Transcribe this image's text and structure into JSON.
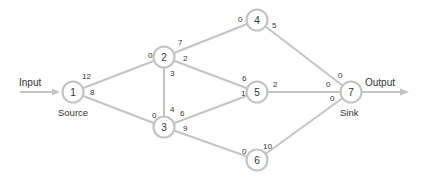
{
  "colors": {
    "edge": "#c4c4c4",
    "node_stroke": "#c4c4c4",
    "node_fill": "#ffffff",
    "text": "#333333"
  },
  "labels": {
    "input": "Input",
    "output": "Output",
    "source": "Source",
    "sink": "Sink"
  },
  "nodes": [
    {
      "id": "1",
      "label": "1",
      "x": 73,
      "y": 92
    },
    {
      "id": "2",
      "label": "2",
      "x": 164,
      "y": 57
    },
    {
      "id": "3",
      "label": "3",
      "x": 164,
      "y": 127
    },
    {
      "id": "4",
      "label": "4",
      "x": 257,
      "y": 20
    },
    {
      "id": "5",
      "label": "5",
      "x": 257,
      "y": 92
    },
    {
      "id": "6",
      "label": "6",
      "x": 257,
      "y": 160
    },
    {
      "id": "7",
      "label": "7",
      "x": 351,
      "y": 92
    }
  ],
  "edges": [
    {
      "from": "1",
      "to": "2",
      "from_cap": "12",
      "to_cap": "0"
    },
    {
      "from": "1",
      "to": "3",
      "from_cap": "8",
      "to_cap": "0"
    },
    {
      "from": "2",
      "to": "3",
      "from_cap": "3",
      "to_cap": "4"
    },
    {
      "from": "2",
      "to": "4",
      "from_cap": "7",
      "to_cap": "0"
    },
    {
      "from": "2",
      "to": "5",
      "from_cap": "2",
      "to_cap": "6"
    },
    {
      "from": "3",
      "to": "5",
      "from_cap": "6",
      "to_cap": "1"
    },
    {
      "from": "3",
      "to": "6",
      "from_cap": "9",
      "to_cap": "0"
    },
    {
      "from": "4",
      "to": "7",
      "from_cap": "5",
      "to_cap": "0"
    },
    {
      "from": "5",
      "to": "7",
      "from_cap": "2",
      "to_cap": "0"
    },
    {
      "from": "6",
      "to": "7",
      "from_cap": "10",
      "to_cap": "0"
    }
  ],
  "capacity_labels": [
    {
      "text": "12",
      "x": 82,
      "y": 79
    },
    {
      "text": "8",
      "x": 90,
      "y": 95
    },
    {
      "text": "0",
      "x": 148,
      "y": 58
    },
    {
      "text": "7",
      "x": 178,
      "y": 45
    },
    {
      "text": "2",
      "x": 183,
      "y": 61
    },
    {
      "text": "3",
      "x": 170,
      "y": 76
    },
    {
      "text": "4",
      "x": 170,
      "y": 112
    },
    {
      "text": "0",
      "x": 152,
      "y": 118
    },
    {
      "text": "6",
      "x": 180,
      "y": 116
    },
    {
      "text": "9",
      "x": 183,
      "y": 131
    },
    {
      "text": "0",
      "x": 238,
      "y": 22
    },
    {
      "text": "5",
      "x": 272,
      "y": 28
    },
    {
      "text": "6",
      "x": 242,
      "y": 81
    },
    {
      "text": "1",
      "x": 241,
      "y": 96
    },
    {
      "text": "2",
      "x": 273,
      "y": 87
    },
    {
      "text": "0",
      "x": 242,
      "y": 154
    },
    {
      "text": "10",
      "x": 263,
      "y": 149
    },
    {
      "text": "0",
      "x": 338,
      "y": 78
    },
    {
      "text": "0",
      "x": 326,
      "y": 87
    },
    {
      "text": "0",
      "x": 330,
      "y": 101
    }
  ]
}
